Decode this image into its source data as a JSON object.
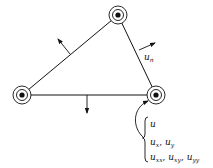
{
  "diagram": {
    "type": "triangular-finite-element",
    "colors": {
      "stroke": "#111111",
      "background": "#ffffff"
    },
    "nodes": [
      {
        "id": "top",
        "x": 118,
        "y": 15
      },
      {
        "id": "left",
        "x": 22,
        "y": 95
      },
      {
        "id": "right",
        "x": 156,
        "y": 95
      }
    ],
    "edges": [
      {
        "from": "left",
        "to": "top"
      },
      {
        "from": "top",
        "to": "right"
      },
      {
        "from": "left",
        "to": "right"
      }
    ],
    "normals": [
      {
        "edge": "left-top",
        "from": [
          70,
          54
        ],
        "to": [
          58,
          39
        ]
      },
      {
        "edge": "top-right",
        "from": [
          139,
          50
        ],
        "to": [
          155,
          43
        ],
        "label": "u_n"
      },
      {
        "edge": "left-right",
        "from": [
          87,
          95
        ],
        "to": [
          87,
          113
        ]
      }
    ],
    "labels": {
      "normal_derivative": {
        "base": "u",
        "sub": "n"
      },
      "dof_line1": {
        "base": "u"
      },
      "dof_line2": {
        "a": "u",
        "a_sub": "x",
        "sep": ", ",
        "b": "u",
        "b_sub": "y"
      },
      "dof_line3": {
        "a": "u",
        "a_sub": "xx",
        "sep1": ", ",
        "b": "u",
        "b_sub": "xy",
        "sep2": ", ",
        "c": "u",
        "c_sub": "yy"
      }
    }
  }
}
